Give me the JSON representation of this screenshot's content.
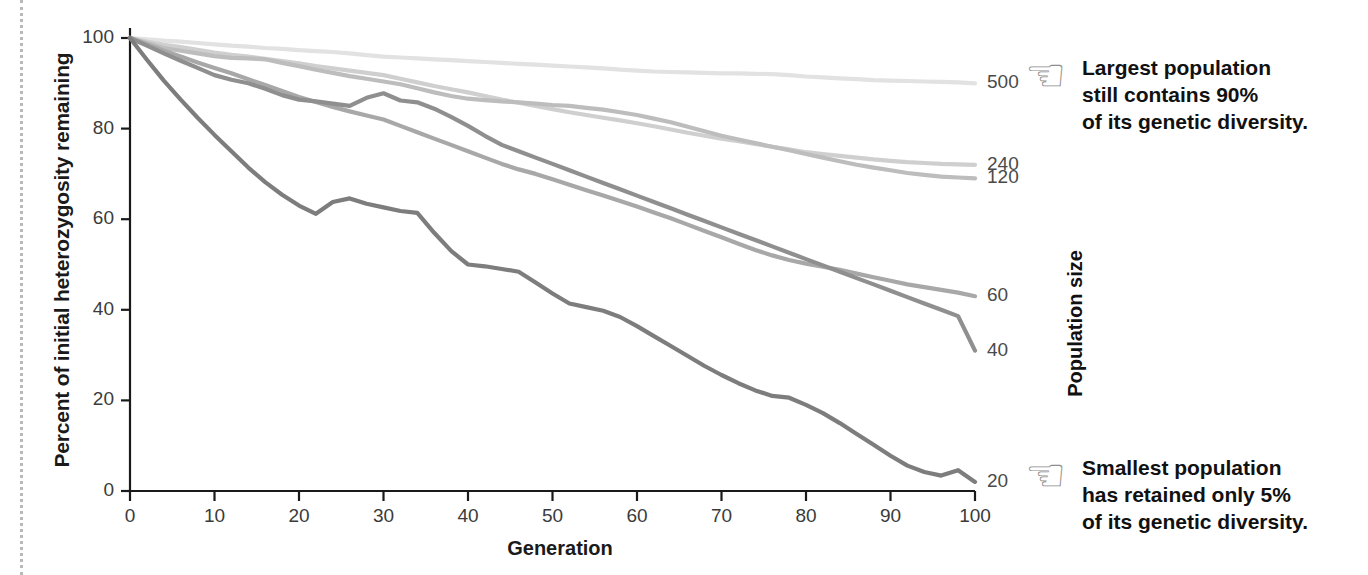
{
  "chart_data": {
    "type": "line",
    "title": "",
    "xlabel": "Generation",
    "ylabel": "Percent of initial heterozygosity remaining",
    "xlim": [
      0,
      100
    ],
    "ylim": [
      0,
      100
    ],
    "xticks": [
      "0",
      "10",
      "20",
      "30",
      "40",
      "50",
      "60",
      "70",
      "80",
      "90",
      "100"
    ],
    "yticks": [
      "0",
      "20",
      "40",
      "60",
      "80",
      "100"
    ],
    "grid": false,
    "legend_position": "right-end-labels",
    "legend_title": "Population size",
    "x": [
      0,
      2,
      4,
      6,
      8,
      10,
      12,
      14,
      16,
      18,
      20,
      22,
      24,
      26,
      28,
      30,
      32,
      34,
      36,
      38,
      40,
      42,
      44,
      46,
      48,
      50,
      52,
      54,
      56,
      58,
      60,
      62,
      64,
      66,
      68,
      70,
      72,
      74,
      76,
      78,
      80,
      82,
      84,
      86,
      88,
      90,
      92,
      94,
      96,
      98,
      100
    ],
    "series": [
      {
        "name": "500",
        "color": "#e2e2e2",
        "end_value": 90,
        "values": [
          100,
          99.7,
          99.4,
          99.2,
          98.9,
          98.6,
          98.3,
          98.1,
          97.8,
          97.6,
          97.3,
          97.1,
          96.9,
          96.6,
          96.2,
          95.9,
          95.7,
          95.5,
          95.3,
          95.1,
          94.9,
          94.7,
          94.5,
          94.3,
          94.1,
          93.9,
          93.7,
          93.5,
          93.3,
          93.0,
          92.8,
          92.6,
          92.5,
          92.4,
          92.3,
          92.2,
          92.2,
          92.1,
          92.0,
          91.8,
          91.5,
          91.3,
          91.1,
          90.9,
          90.7,
          90.6,
          90.5,
          90.4,
          90.3,
          90.2,
          90.0
        ]
      },
      {
        "name": "240",
        "color": "#cfcfcf",
        "end_value": 72,
        "values": [
          100,
          99.2,
          98.5,
          98.0,
          97.4,
          96.8,
          96.3,
          95.9,
          95.4,
          94.9,
          94.4,
          93.8,
          93.3,
          92.8,
          92.3,
          91.8,
          91.0,
          90.2,
          89.4,
          88.7,
          88.0,
          87.2,
          86.4,
          85.7,
          85.0,
          84.3,
          83.6,
          83.0,
          82.4,
          81.8,
          81.2,
          80.5,
          79.8,
          79.1,
          78.4,
          77.8,
          77.2,
          76.6,
          76.0,
          75.4,
          74.8,
          74.4,
          74.0,
          73.6,
          73.2,
          72.9,
          72.6,
          72.4,
          72.2,
          72.1,
          72.0
        ]
      },
      {
        "name": "120",
        "color": "#bdbdbd",
        "end_value": 69,
        "values": [
          100,
          98.9,
          97.8,
          97.2,
          96.6,
          96.0,
          95.6,
          95.5,
          95.3,
          94.5,
          93.8,
          93.0,
          92.3,
          91.6,
          91.0,
          90.4,
          89.8,
          88.9,
          88.0,
          87.2,
          86.6,
          86.3,
          86.0,
          85.8,
          85.5,
          85.2,
          85.0,
          84.6,
          84.2,
          83.6,
          83.0,
          82.2,
          81.4,
          80.4,
          79.4,
          78.4,
          77.6,
          76.8,
          76.0,
          75.2,
          74.4,
          73.6,
          72.8,
          72.0,
          71.4,
          70.8,
          70.2,
          69.8,
          69.4,
          69.2,
          69.0
        ]
      },
      {
        "name": "60",
        "color": "#a8a8a8",
        "end_value": 43,
        "values": [
          100,
          98.6,
          97.2,
          95.9,
          94.6,
          93.4,
          92.2,
          90.9,
          89.6,
          88.3,
          87.0,
          85.9,
          84.8,
          83.8,
          82.9,
          82.0,
          80.6,
          79.2,
          77.8,
          76.4,
          75.0,
          73.6,
          72.2,
          71.0,
          70.0,
          68.8,
          67.6,
          66.4,
          65.2,
          64.0,
          62.8,
          61.5,
          60.2,
          58.8,
          57.4,
          56.0,
          54.6,
          53.2,
          52.0,
          51.0,
          50.2,
          49.5,
          48.8,
          48.0,
          47.2,
          46.4,
          45.6,
          45.0,
          44.4,
          43.8,
          43.0
        ]
      },
      {
        "name": "40",
        "color": "#8f8f8f",
        "end_value": 31,
        "values": [
          100,
          98.3,
          96.6,
          95.0,
          93.4,
          91.8,
          90.8,
          90.0,
          88.8,
          87.4,
          86.4,
          86.0,
          85.5,
          85.0,
          86.8,
          87.8,
          86.2,
          85.8,
          84.4,
          82.6,
          80.6,
          78.4,
          76.4,
          75.0,
          73.6,
          72.2,
          70.8,
          69.4,
          68.0,
          66.6,
          65.2,
          63.8,
          62.4,
          61.0,
          59.6,
          58.2,
          56.8,
          55.4,
          54.0,
          52.6,
          51.2,
          49.8,
          48.4,
          47.0,
          45.6,
          44.2,
          42.8,
          41.4,
          40.0,
          38.6,
          31.0
        ]
      },
      {
        "name": "20",
        "color": "#7d7d7d",
        "end_value": 2,
        "values": [
          100,
          95.2,
          90.6,
          86.4,
          82.4,
          78.6,
          75.0,
          71.4,
          68.2,
          65.4,
          63.0,
          61.2,
          63.8,
          64.6,
          63.4,
          62.6,
          61.8,
          61.4,
          57.0,
          53.0,
          50.0,
          49.6,
          49.0,
          48.4,
          46.0,
          43.6,
          41.4,
          40.6,
          39.8,
          38.4,
          36.4,
          34.2,
          32.0,
          29.8,
          27.6,
          25.6,
          23.8,
          22.2,
          21.0,
          20.6,
          19.0,
          17.2,
          15.0,
          12.6,
          10.2,
          7.8,
          5.6,
          4.2,
          3.4,
          4.6,
          2.0
        ]
      }
    ],
    "annotations": [
      {
        "id": "callout-largest",
        "icon": "pointing-hand-left-icon",
        "text": "Largest population\nstill contains 90%\nof its genetic diversity.",
        "target_series": "500"
      },
      {
        "id": "callout-smallest",
        "icon": "pointing-hand-left-icon",
        "text": "Smallest population\nhas retained only 5%\nof its genetic diversity.",
        "target_series": "20"
      }
    ]
  },
  "colors": {
    "axis": "#1a1a1a",
    "tick_text": "#3b3b3b",
    "title_text": "#111111",
    "dotted_rule": "#b9b9b9"
  }
}
